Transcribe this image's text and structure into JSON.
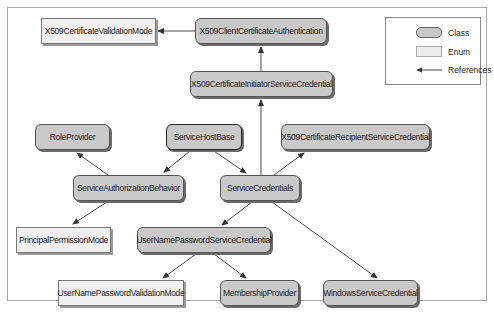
{
  "diagram": {
    "type": "class-reference-diagram",
    "nodes": [
      {
        "id": "x509-validation-mode",
        "label": "X509CertificateValidationMode",
        "kind": "Enum"
      },
      {
        "id": "x509-client-auth",
        "label": "X509ClientCertificateAuthentication",
        "kind": "Class"
      },
      {
        "id": "x509-initiator",
        "label": "X509CertificateInitiatorServiceCredential",
        "kind": "Class"
      },
      {
        "id": "role-provider",
        "label": "RoleProvider",
        "kind": "Class"
      },
      {
        "id": "service-host-base",
        "label": "ServiceHostBase",
        "kind": "Class"
      },
      {
        "id": "x509-recipient",
        "label": "X509CertificateRecipientServiceCredential",
        "kind": "Class"
      },
      {
        "id": "service-authorization-behavior",
        "label": "ServiceAuthorizationBehavior",
        "kind": "Class"
      },
      {
        "id": "service-credentials",
        "label": "ServiceCredentials",
        "kind": "Class"
      },
      {
        "id": "principal-permission-mode",
        "label": "PrincipalPermissionMode",
        "kind": "Enum"
      },
      {
        "id": "username-password-credential",
        "label": "UserNamePasswordServiceCredential",
        "kind": "Class"
      },
      {
        "id": "username-password-validation-mode",
        "label": "UserNamePasswordValidationMode",
        "kind": "Enum"
      },
      {
        "id": "membership-provider",
        "label": "MembershipProvider",
        "kind": "Class"
      },
      {
        "id": "windows-service-credential",
        "label": "WindowsServiceCredential",
        "kind": "Class"
      }
    ],
    "edges": [
      {
        "from": "X509ClientCertificateAuthentication",
        "to": "X509CertificateValidationMode"
      },
      {
        "from": "X509CertificateInitiatorServiceCredential",
        "to": "X509ClientCertificateAuthentication"
      },
      {
        "from": "ServiceCredentials",
        "to": "X509CertificateInitiatorServiceCredential"
      },
      {
        "from": "ServiceCredentials",
        "to": "X509CertificateRecipientServiceCredential"
      },
      {
        "from": "ServiceHostBase",
        "to": "ServiceAuthorizationBehavior"
      },
      {
        "from": "ServiceHostBase",
        "to": "ServiceCredentials"
      },
      {
        "from": "ServiceAuthorizationBehavior",
        "to": "RoleProvider"
      },
      {
        "from": "ServiceAuthorizationBehavior",
        "to": "PrincipalPermissionMode"
      },
      {
        "from": "ServiceCredentials",
        "to": "UserNamePasswordServiceCredential"
      },
      {
        "from": "ServiceCredentials",
        "to": "WindowsServiceCredential"
      },
      {
        "from": "UserNamePasswordServiceCredential",
        "to": "UserNamePasswordValidationMode"
      },
      {
        "from": "UserNamePasswordServiceCredential",
        "to": "MembershipProvider"
      }
    ]
  },
  "legend": {
    "class_label": "Class",
    "enum_label": "Enum",
    "references_label": "References"
  },
  "colors": {
    "class_fill": "#c9c9c9",
    "enum_fill": "#f0f0f0",
    "edge": "#333333"
  }
}
